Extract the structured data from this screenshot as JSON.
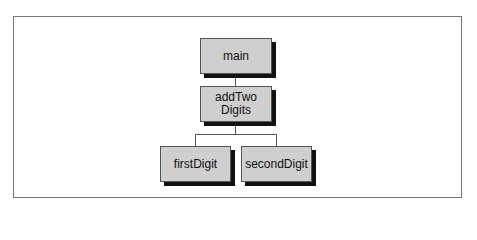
{
  "diagram": {
    "type": "hierarchy-chart",
    "nodes": [
      {
        "id": "main",
        "label": "main"
      },
      {
        "id": "addTwoDigits",
        "label": "addTwo\nDigits"
      },
      {
        "id": "firstDigit",
        "label": "firstDigit"
      },
      {
        "id": "secondDigit",
        "label": "secondDigit"
      }
    ],
    "edges": [
      {
        "from": "main",
        "to": "addTwoDigits"
      },
      {
        "from": "addTwoDigits",
        "to": "firstDigit"
      },
      {
        "from": "addTwoDigits",
        "to": "secondDigit"
      }
    ]
  },
  "labels": {
    "main": "main",
    "addTwo_line1": "addTwo",
    "addTwo_line2": "Digits",
    "firstDigit": "firstDigit",
    "secondDigit": "secondDigit"
  }
}
